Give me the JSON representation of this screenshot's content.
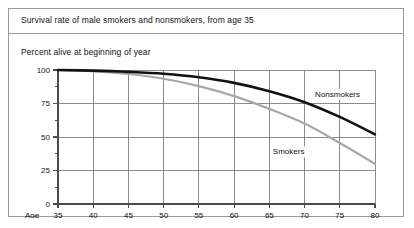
{
  "figure": {
    "title": "Survival rate of male smokers and nonsmokers, from age 35",
    "subtitle": "Percent alive at beginning of year",
    "axis_name": "Age",
    "border_color": "#9a9a9a",
    "background": "#ffffff"
  },
  "chart_data": {
    "type": "line",
    "title": "Survival rate of male smokers and nonsmokers, from age 35",
    "subtitle": "Percent alive at beginning of year",
    "xlabel": "Age",
    "ylabel": "Percent alive at beginning of year",
    "xlim": [
      35,
      80
    ],
    "ylim": [
      0,
      100
    ],
    "xticks": [
      35,
      40,
      45,
      50,
      55,
      60,
      65,
      70,
      75,
      80
    ],
    "xtick_labels": [
      "35",
      "40",
      "45",
      "50",
      "55",
      "60",
      "65",
      "70",
      "75",
      "80"
    ],
    "yticks": [
      0,
      25,
      50,
      75,
      100
    ],
    "ytick_labels": [
      "0",
      "25",
      "50",
      "75",
      "100"
    ],
    "yminor_ticks": [
      12.5,
      37.5,
      62.5,
      87.5
    ],
    "grid": true,
    "grid_color": "#808080",
    "legend": "inline-labels",
    "x": [
      35,
      40,
      45,
      50,
      55,
      60,
      65,
      70,
      75,
      80
    ],
    "series": [
      {
        "name": "Nonsmokers",
        "color": "#111111",
        "width": 2.6,
        "label_x": 71.5,
        "label_y": 80,
        "values": [
          100,
          99.5,
          98.6,
          97.2,
          94.6,
          90.4,
          84.2,
          76.0,
          65.0,
          52.0
        ]
      },
      {
        "name": "Smokers",
        "color": "#a8a8a8",
        "width": 2.2,
        "label_x": 65.5,
        "label_y": 37,
        "values": [
          100,
          99.0,
          97.0,
          93.5,
          88.0,
          80.5,
          71.0,
          60.0,
          45.5,
          30.0
        ]
      }
    ]
  }
}
